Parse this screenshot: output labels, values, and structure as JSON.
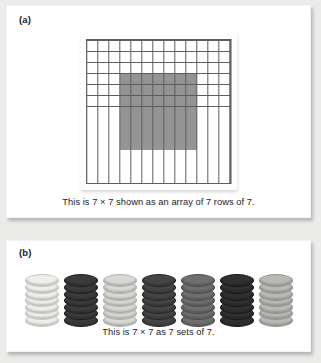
{
  "figure": {
    "background_color": "#ebebea",
    "panel_background": "#ffffff"
  },
  "panel_a": {
    "label": "(a)",
    "caption": "This is 7 × 7 shown as an array of 7 rows of 7.",
    "grid": {
      "columns": 13,
      "rows": 13,
      "shaded_start_col": 4,
      "shaded_start_row": 4,
      "shaded_cols": 7,
      "shaded_rows": 7,
      "cell_color": "#ffffff",
      "shaded_color": "#949494",
      "line_color": "#5e5e5e"
    }
  },
  "panel_b": {
    "label": "(b)",
    "caption": "This is 7 × 7 as 7 sets of 7.",
    "stacks": [
      {
        "name": "stack-1",
        "count": 7,
        "fill": "#eeeeea",
        "edge": "#c4c4bf"
      },
      {
        "name": "stack-2",
        "count": 7,
        "fill": "#3b3b3b",
        "edge": "#1c1c1c"
      },
      {
        "name": "stack-3",
        "count": 7,
        "fill": "#d8d8d4",
        "edge": "#aeaea9"
      },
      {
        "name": "stack-4",
        "count": 7,
        "fill": "#454545",
        "edge": "#242424"
      },
      {
        "name": "stack-5",
        "count": 7,
        "fill": "#6f6f6f",
        "edge": "#4a4a4a"
      },
      {
        "name": "stack-6",
        "count": 7,
        "fill": "#303030",
        "edge": "#161616"
      },
      {
        "name": "stack-7",
        "count": 7,
        "fill": "#b9b9b5",
        "edge": "#90908c"
      }
    ]
  }
}
